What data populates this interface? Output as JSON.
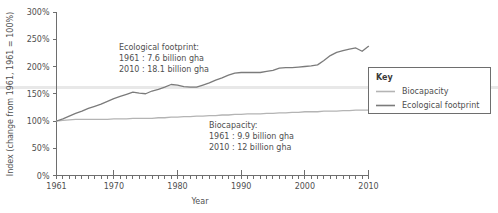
{
  "chart_data": {
    "type": "line",
    "title": "",
    "xlabel": "Year",
    "ylabel": "Index (change from 1961, 1961 = 100%)",
    "xlim": [
      1961,
      2010
    ],
    "ylim": [
      0,
      300
    ],
    "grid": false,
    "legend_position": "right",
    "x_ticks": [
      1961,
      1970,
      1980,
      1990,
      2000,
      2010
    ],
    "x_tick_labels": [
      "1961",
      "1970",
      "1980",
      "1990",
      "2000",
      "2010"
    ],
    "x_minor_tick_interval": 1,
    "y_ticks": [
      0,
      50,
      100,
      150,
      200,
      250,
      300
    ],
    "y_tick_labels": [
      "0%",
      "50%",
      "100%",
      "150%",
      "200%",
      "250%",
      "300%"
    ],
    "x": [
      1961,
      1962,
      1963,
      1964,
      1965,
      1966,
      1967,
      1968,
      1969,
      1970,
      1971,
      1972,
      1973,
      1974,
      1975,
      1976,
      1977,
      1978,
      1979,
      1980,
      1981,
      1982,
      1983,
      1984,
      1985,
      1986,
      1987,
      1988,
      1989,
      1990,
      1991,
      1992,
      1993,
      1994,
      1995,
      1996,
      1997,
      1998,
      1999,
      2000,
      2001,
      2002,
      2003,
      2004,
      2005,
      2006,
      2007,
      2008,
      2009,
      2010
    ],
    "series": [
      {
        "name": "Ecological footprint",
        "color": "#7b7b7b",
        "values": [
          100,
          104,
          109,
          114,
          118,
          123,
          127,
          131,
          136,
          141,
          145,
          149,
          153,
          151,
          150,
          155,
          158,
          162,
          167,
          166,
          163,
          162,
          162,
          166,
          170,
          175,
          179,
          184,
          188,
          189,
          189,
          189,
          189,
          191,
          193,
          197,
          198,
          198,
          199,
          200,
          201,
          203,
          211,
          220,
          226,
          229,
          232,
          234,
          228,
          237
        ]
      },
      {
        "name": "Biocapacity",
        "color": "#b4b4b4",
        "values": [
          100,
          101,
          102,
          103,
          103,
          103,
          103,
          103,
          103,
          104,
          104,
          104,
          105,
          105,
          105,
          105,
          106,
          106,
          107,
          107,
          108,
          108,
          109,
          109,
          110,
          110,
          111,
          111,
          112,
          112,
          113,
          113,
          113,
          114,
          114,
          115,
          115,
          116,
          116,
          117,
          117,
          117,
          118,
          118,
          118,
          119,
          119,
          120,
          120,
          120
        ]
      }
    ],
    "annotations": [
      {
        "id": "footprint-annotation",
        "lines": [
          "Ecological footprint:",
          "1961 : 7.6 billion gha",
          "2010 : 18.1 billion gha"
        ]
      },
      {
        "id": "biocapacity-annotation",
        "lines": [
          "Biocapacity:",
          "1961 : 9.9 billion gha",
          "2010 : 12 billion gha"
        ]
      }
    ],
    "legend": {
      "title": "Key",
      "entries": [
        {
          "label": "Biocapacity",
          "color": "#b4b4b4"
        },
        {
          "label": "Ecological footprint",
          "color": "#7b7b7b"
        }
      ]
    }
  },
  "axis": {
    "x_title": "Year",
    "y_title": "Index (change from 1961, 1961 = 100%)",
    "y_labels": [
      "300%",
      "250%",
      "200%",
      "150%",
      "100%",
      "50%",
      "0%"
    ],
    "x_labels": [
      "1961",
      "1970",
      "1980",
      "1990",
      "2000",
      "2010"
    ]
  },
  "annotation_footprint": {
    "line1": "Ecological footprint:",
    "line2": "1961 : 7.6 billion gha",
    "line3": "2010 : 18.1 billion gha"
  },
  "annotation_biocapacity": {
    "line1": "Biocapacity:",
    "line2": "1961 : 9.9 billion gha",
    "line3": "2010 : 12 billion gha"
  },
  "legend": {
    "title": "Key",
    "item1": "Biocapacity",
    "item2": "Ecological footprint"
  },
  "colors": {
    "footprint": "#7b7b7b",
    "biocapacity": "#b4b4b4",
    "axis": "#6e6e6e",
    "text": "#4f4f4f"
  }
}
